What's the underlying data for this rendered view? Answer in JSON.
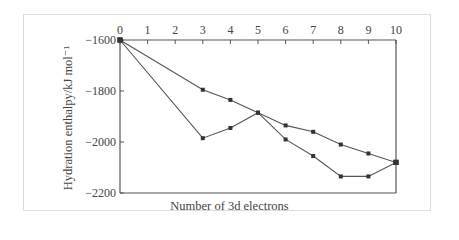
{
  "chart_data": {
    "type": "line",
    "title": "",
    "xlabel": "Number of 3d electrons",
    "ylabel": "Hydration enthalpy/kJ mol⁻¹",
    "x_ticks": [
      "0",
      "1",
      "2",
      "3",
      "4",
      "5",
      "6",
      "7",
      "8",
      "9",
      "10"
    ],
    "y_ticks": [
      "−1600",
      "−1800",
      "−2000",
      "−2200"
    ],
    "xlim": [
      0,
      10
    ],
    "ylim": [
      -2200,
      -1600
    ],
    "grid": false,
    "legend": null,
    "x_axis_position": "top",
    "series": [
      {
        "name": "upper line (smooth trend)",
        "x": [
          0,
          3,
          4,
          5,
          6,
          7,
          8,
          9,
          10
        ],
        "values": [
          -1600,
          -1795,
          -1835,
          -1885,
          -1935,
          -1960,
          -2010,
          -2045,
          -2080
        ]
      },
      {
        "name": "lower line (observed values)",
        "x": [
          0,
          3,
          4,
          5,
          6,
          7,
          8,
          9,
          10
        ],
        "values": [
          -1600,
          -1985,
          -1945,
          -1885,
          -1990,
          -2055,
          -2135,
          -2135,
          -2080
        ]
      }
    ]
  }
}
